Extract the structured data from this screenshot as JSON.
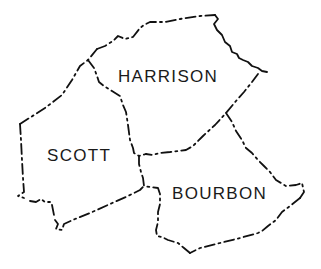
{
  "map": {
    "type": "county-outline-map",
    "line_color": "#111111",
    "background": "#ffffff",
    "counties": [
      {
        "name": "HARRISON",
        "label_x": 118,
        "label_y": 68
      },
      {
        "name": "SCOTT",
        "label_x": 47,
        "label_y": 147
      },
      {
        "name": "BOURBON",
        "label_x": 172,
        "label_y": 185
      }
    ]
  }
}
